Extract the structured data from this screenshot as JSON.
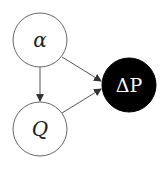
{
  "diagram": {
    "type": "directed-graph",
    "nodes": [
      {
        "id": "alpha",
        "label": "α",
        "italic": true,
        "fill": "#ffffff",
        "text_color": "#222222"
      },
      {
        "id": "Q",
        "label": "Q",
        "italic": true,
        "fill": "#ffffff",
        "text_color": "#222222"
      },
      {
        "id": "deltaP",
        "label": "ΔP",
        "italic": false,
        "fill": "#000000",
        "text_color": "#ffffff"
      }
    ],
    "edges": [
      {
        "from": "alpha",
        "to": "Q"
      },
      {
        "from": "alpha",
        "to": "deltaP"
      },
      {
        "from": "Q",
        "to": "deltaP"
      }
    ],
    "colors": {
      "stroke": "#555555",
      "observed_fill": "#000000",
      "latent_fill": "#ffffff"
    }
  }
}
